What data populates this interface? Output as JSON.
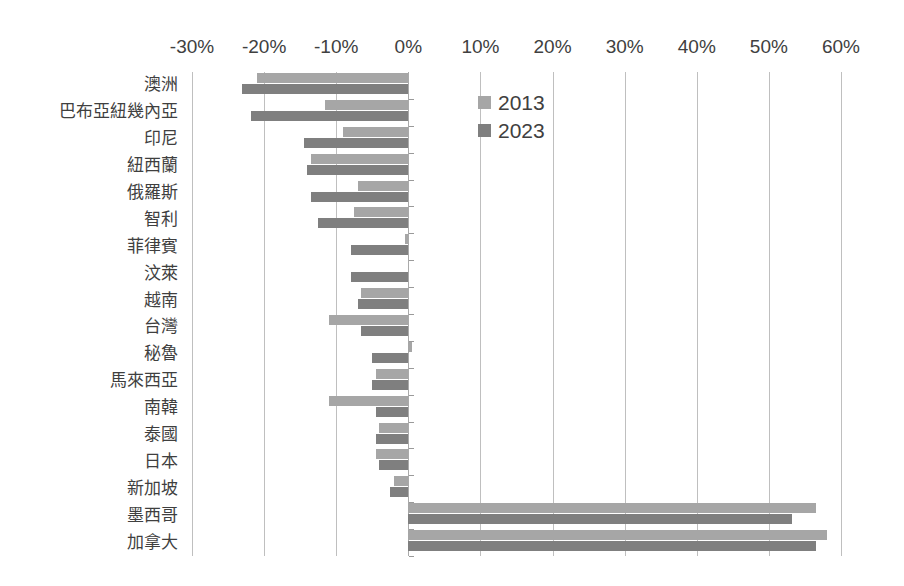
{
  "chart_data": {
    "type": "bar",
    "orientation": "horizontal",
    "title": "",
    "subtitle": "",
    "xlabel": "",
    "ylabel": "",
    "xlim": [
      -30,
      60
    ],
    "xticks": [
      -30,
      -20,
      -10,
      0,
      10,
      20,
      30,
      40,
      50,
      60
    ],
    "xtick_labels": [
      "-30%",
      "-20%",
      "-10%",
      "0%",
      "10%",
      "20%",
      "30%",
      "40%",
      "50%",
      "60%"
    ],
    "grid": true,
    "grid_axis": "x",
    "axis_position": "top",
    "legend_position": "inside-top-left",
    "categories": [
      "澳洲",
      "巴布亞紐幾內亞",
      "印尼",
      "紐西蘭",
      "俄羅斯",
      "智利",
      "菲律賓",
      "汶萊",
      "越南",
      "台灣",
      "秘魯",
      "馬來西亞",
      "南韓",
      "泰國",
      "日本",
      "新加坡",
      "墨西哥",
      "加拿大"
    ],
    "series": [
      {
        "name": "2013",
        "color": "#a6a6a6",
        "values": [
          -21.0,
          -11.5,
          -9.0,
          -13.5,
          -7.0,
          -7.5,
          -0.5,
          0.0,
          -6.5,
          -11.0,
          0.5,
          -4.5,
          -11.0,
          -4.0,
          -4.5,
          -2.0,
          56.5,
          58.0
        ]
      },
      {
        "name": "2023",
        "color": "#7f7f7f",
        "values": [
          -23.0,
          -21.8,
          -14.5,
          -14.0,
          -13.5,
          -12.5,
          -8.0,
          -8.0,
          -7.0,
          -6.5,
          -5.0,
          -5.0,
          -4.5,
          -4.5,
          -4.0,
          -2.5,
          53.2,
          56.5
        ]
      }
    ]
  },
  "legend": {
    "items": [
      {
        "label": "2013",
        "color": "#a6a6a6"
      },
      {
        "label": "2023",
        "color": "#7f7f7f"
      }
    ]
  },
  "colors": {
    "series_2013": "#a6a6a6",
    "series_2023": "#7f7f7f",
    "gridline": "#bfbfbf",
    "text": "#3f3f3f",
    "background": "#ffffff"
  }
}
